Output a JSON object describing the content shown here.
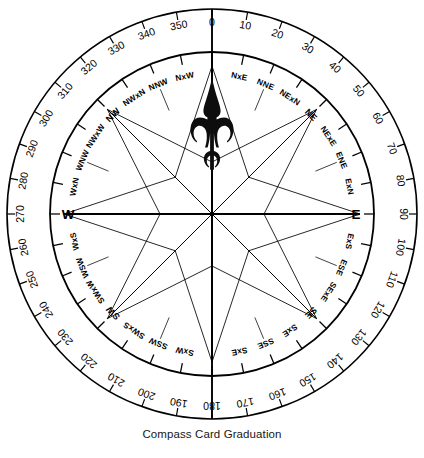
{
  "figure": {
    "caption": "Compass Card Graduation",
    "title": "Compass Card Graduation"
  },
  "geometry": {
    "center_x": 212,
    "center_y": 214,
    "outer_ring_radius": 205,
    "degree_label_radius": 192,
    "degree_tick_outer": 205,
    "degree_tick_inner": 197,
    "inner_ring_radius": 162,
    "point_tick_outer": 162,
    "point_tick_inner": 152,
    "point_label_radius": 140,
    "star_outer_radius": 148,
    "cardinal_line_radius": 148,
    "spoke_inner_radius": 112,
    "spoke_outer_radius": 135
  },
  "colors": {
    "ink": "#000000",
    "fleur": "#0d0d0d",
    "background": "#ffffff",
    "caption": "#171717"
  },
  "degree_scale": {
    "units": "degrees",
    "step": 10,
    "range": [
      0,
      350
    ],
    "tick_interval": 10,
    "labels": [
      "0",
      "10",
      "20",
      "30",
      "40",
      "50",
      "60",
      "70",
      "80",
      "90",
      "100",
      "110",
      "120",
      "130",
      "140",
      "150",
      "160",
      "170",
      "180",
      "190",
      "200",
      "210",
      "220",
      "230",
      "240",
      "250",
      "260",
      "270",
      "280",
      "290",
      "300",
      "310",
      "320",
      "330",
      "340",
      "350"
    ]
  },
  "compass_points": {
    "count": 32,
    "step_degrees": 11.25,
    "names": [
      "N",
      "NxE",
      "NNE",
      "NExN",
      "NE",
      "NExE",
      "ENE",
      "ExN",
      "E",
      "ExS",
      "ESE",
      "SExE",
      "SE",
      "SxE",
      "SSE",
      "SxE",
      "S",
      "SxW",
      "SSW",
      "SWxS",
      "SW",
      "SWxW",
      "WSW",
      "WxS",
      "W",
      "WxN",
      "WNW",
      "NWxW",
      "NW",
      "NWxN",
      "NNW",
      "NxW"
    ],
    "hidden_labels": [
      "N",
      "S"
    ],
    "cardinals": [
      "N",
      "E",
      "S",
      "W"
    ],
    "visible_cardinal_letters": [
      "W",
      "E"
    ]
  },
  "north_marker": {
    "icon": "fleur-de-lis-icon",
    "label": "North"
  },
  "star": {
    "rays": 8,
    "long_ray_bearings": [
      0,
      45,
      90,
      135,
      180,
      225,
      270,
      315
    ],
    "description": "eight-point compass star"
  }
}
